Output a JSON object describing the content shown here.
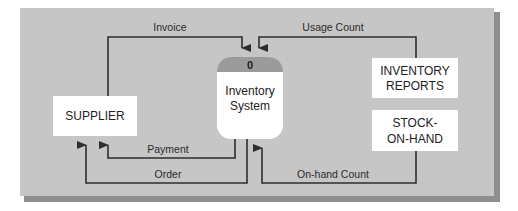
{
  "diagram": {
    "type": "context data flow diagram",
    "colors": {
      "panel": "#c4c4c4",
      "panel_shadow": "#8e8e8e",
      "box_fill": "#ffffff",
      "process_header": "#9b9b9b",
      "line": "#2e2e2e"
    },
    "process": {
      "number": "0",
      "line1": "Inventory",
      "line2": "System"
    },
    "entities": {
      "supplier": {
        "line1": "SUPPLIER"
      },
      "inventory_reports": {
        "line1": "INVENTORY",
        "line2": "REPORTS"
      },
      "stock_on_hand": {
        "line1": "STOCK-",
        "line2": "ON-HAND"
      }
    },
    "flows": {
      "invoice": "Invoice",
      "usage_count": "Usage Count",
      "payment": "Payment",
      "order": "Order",
      "on_hand_count": "On-hand Count"
    }
  }
}
